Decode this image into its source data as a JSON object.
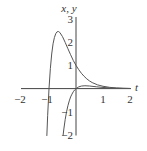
{
  "chart_data": {
    "type": "line",
    "title": "",
    "xlabel": "t",
    "ylabel": "x, y",
    "xlim": [
      -2,
      2
    ],
    "ylim": [
      -2,
      3
    ],
    "grid": false,
    "legend": "none",
    "x_ticks": [
      {
        "value": -2,
        "label": "−2"
      },
      {
        "value": -1,
        "label": "−1"
      },
      {
        "value": 1,
        "label": "1"
      },
      {
        "value": 2,
        "label": "2"
      }
    ],
    "y_ticks": [
      {
        "value": 3,
        "label": "3"
      },
      {
        "value": 2,
        "label": "2"
      },
      {
        "value": 1,
        "label": "1"
      },
      {
        "value": -1,
        "label": "−1"
      },
      {
        "value": -2,
        "label": "−2"
      }
    ],
    "series": [
      {
        "name": "x(t)",
        "t": [
          -1.08,
          -1.05,
          -1.0,
          -0.95,
          -0.9,
          -0.85,
          -0.8,
          -0.75,
          -0.7,
          -0.65,
          -0.6,
          -0.5,
          -0.4,
          -0.3,
          -0.2,
          -0.1,
          0.0,
          0.1,
          0.2,
          0.3,
          0.4,
          0.5,
          0.6,
          0.8,
          1.0,
          1.25,
          1.5,
          1.75,
          2.0
        ],
        "values": [
          -2.04,
          -1.17,
          0.0,
          0.86,
          1.49,
          1.93,
          2.2,
          2.37,
          2.45,
          2.46,
          2.42,
          2.24,
          1.99,
          1.72,
          1.46,
          1.21,
          1.0,
          0.82,
          0.66,
          0.53,
          0.42,
          0.33,
          0.26,
          0.16,
          0.1,
          0.053,
          0.028,
          0.014,
          0.007
        ]
      },
      {
        "name": "y(t)",
        "t": [
          -0.48,
          -0.45,
          -0.4,
          -0.35,
          -0.3,
          -0.25,
          -0.2,
          -0.15,
          -0.1,
          -0.05,
          0.0,
          0.1,
          0.2,
          0.33,
          0.5,
          0.75,
          1.0,
          1.25,
          1.5,
          1.75,
          2.0
        ],
        "values": [
          -2.03,
          -1.74,
          -1.33,
          -1.0,
          -0.74,
          -0.53,
          -0.36,
          -0.24,
          -0.135,
          -0.058,
          0.0,
          0.074,
          0.11,
          0.123,
          0.112,
          0.079,
          0.05,
          0.029,
          0.017,
          0.009,
          0.005
        ]
      }
    ]
  }
}
